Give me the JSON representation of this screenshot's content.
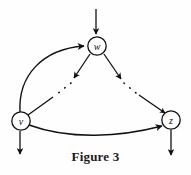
{
  "figure": {
    "caption": "Figure 3",
    "background_color": "#fefefe",
    "ink_color": "#111111"
  },
  "graph": {
    "nodes": [
      {
        "id": "w",
        "label": "w",
        "cx": 97,
        "cy": 46,
        "r": 9
      },
      {
        "id": "v",
        "label": "v",
        "cx": 21,
        "cy": 121,
        "r": 9
      },
      {
        "id": "z",
        "label": "z",
        "cx": 171,
        "cy": 120,
        "r": 9
      }
    ],
    "edges": [
      {
        "id": "in-w",
        "from": "external",
        "to": "w",
        "style": "solid",
        "shape": "straight-down"
      },
      {
        "id": "v-to-w",
        "from": "v",
        "to": "w",
        "style": "solid",
        "shape": "curve-up-right"
      },
      {
        "id": "w-to-v",
        "from": "w",
        "to": "v",
        "style": "dotted-middle",
        "shape": "diagonal-down-left"
      },
      {
        "id": "w-to-z",
        "from": "w",
        "to": "z",
        "style": "dotted-middle",
        "shape": "diagonal-down-right"
      },
      {
        "id": "v-to-z",
        "from": "v",
        "to": "z",
        "style": "solid",
        "shape": "curve-bottom"
      },
      {
        "id": "out-v",
        "from": "v",
        "to": "external",
        "style": "solid",
        "shape": "straight-down"
      },
      {
        "id": "out-z",
        "from": "z",
        "to": "external",
        "style": "solid",
        "shape": "straight-down"
      }
    ]
  }
}
